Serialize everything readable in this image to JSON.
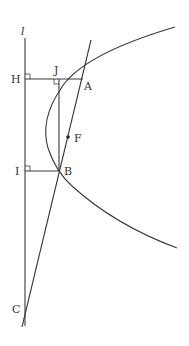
{
  "diagram": {
    "colors": {
      "line": "#3a3a3a",
      "text": "#333333",
      "background": "#ffffff"
    },
    "labels": {
      "directrix": "l",
      "H": "H",
      "J": "J",
      "A": "A",
      "F": "F",
      "I": "I",
      "B": "B",
      "C": "C"
    },
    "points": {
      "H": [
        25,
        79
      ],
      "J": [
        59,
        79
      ],
      "A": [
        83,
        79
      ],
      "F": [
        68,
        137
      ],
      "I": [
        25,
        171
      ],
      "B": [
        60,
        171
      ],
      "C": [
        25,
        308
      ]
    },
    "elements": [
      "directrix line l (vertical)",
      "parabola opening right",
      "segment HA perpendicular to l",
      "segment IB perpendicular to l",
      "segment JB perpendicular to HA",
      "line through A, F, B meeting l at C",
      "right-angle markers at H, I, J"
    ]
  }
}
